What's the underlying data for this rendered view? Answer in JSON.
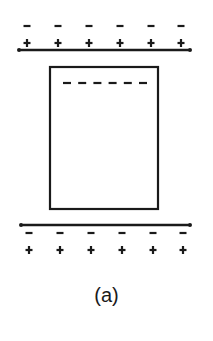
{
  "diagram": {
    "caption": "(a)",
    "stroke_color": "#1a1a1a",
    "background": "#ffffff",
    "top_plate": {
      "y": 50,
      "x1": 19,
      "x2": 190,
      "charges_above": [
        "-",
        "-",
        "-",
        "-",
        "-",
        "-"
      ],
      "charges_below": [
        "+",
        "+",
        "+",
        "+",
        "+",
        "+"
      ],
      "charge_x": [
        27,
        58,
        89,
        120,
        151,
        181
      ]
    },
    "slab": {
      "x": 50,
      "y": 67,
      "width": 108,
      "height": 142,
      "inner_dashes": [
        "-",
        "-",
        "-",
        "-",
        "-",
        "-"
      ]
    },
    "bottom_plate": {
      "y": 225,
      "x1": 21,
      "x2": 190,
      "charges_above": [
        "-",
        "-",
        "-",
        "-",
        "-",
        "-"
      ],
      "charges_below": [
        "+",
        "+",
        "+",
        "+",
        "+",
        "+"
      ],
      "charge_x": [
        29,
        60,
        91,
        122,
        153,
        183
      ]
    }
  }
}
